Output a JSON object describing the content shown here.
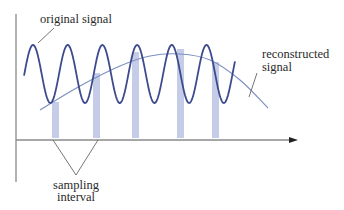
{
  "colors": {
    "background": "#ffffff",
    "original_signal": "#3d4a8c",
    "reconstructed_signal": "#7f90c4",
    "sample_bar": "#c4cce8",
    "axis": "#8a8a8a",
    "leader_line": "#666666",
    "text": "#2a2a2a"
  },
  "labels": {
    "original_signal": "original signal",
    "reconstructed_line1": "reconstructed",
    "reconstructed_line2": "signal",
    "sampling_line1": "sampling",
    "sampling_line2": "interval"
  },
  "axes": {
    "vertical": {
      "x": 16,
      "y1": 14,
      "y2": 182
    },
    "horizontal": {
      "y": 140,
      "x1": 16,
      "x2": 298
    }
  },
  "original_signal": {
    "x_start": 24,
    "x_end": 235,
    "first_peak_x": 33,
    "period": 34.7,
    "peak_y": 45,
    "trough_y": 103
  },
  "reconstructed_signal": {
    "points": [
      [
        40,
        110
      ],
      [
        80,
        86
      ],
      [
        120,
        66
      ],
      [
        150,
        56
      ],
      [
        180,
        54
      ],
      [
        210,
        60
      ],
      [
        240,
        80
      ],
      [
        268,
        108
      ]
    ]
  },
  "sample_bars": [
    {
      "x": 52,
      "width": 7,
      "top": 102
    },
    {
      "x": 93,
      "width": 7,
      "top": 73
    },
    {
      "x": 132,
      "width": 7,
      "top": 52
    },
    {
      "x": 177,
      "width": 7,
      "top": 49
    },
    {
      "x": 212,
      "width": 7,
      "top": 62
    }
  ],
  "bar_bottom": 138,
  "sampling_bracket": {
    "left_x": 53,
    "right_x": 98,
    "top_y": 140,
    "apex_x": 76,
    "apex_y": 175
  }
}
